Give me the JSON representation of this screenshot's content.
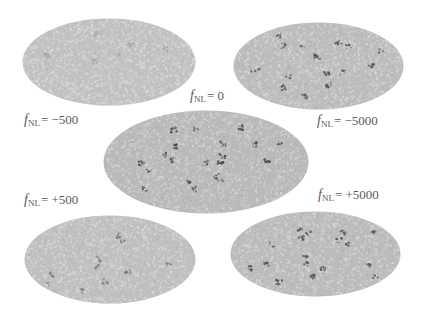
{
  "figure": {
    "maps": [
      {
        "id": "fnl-minus-500",
        "label_prefix": "f",
        "label_sub": "NL",
        "label_value": "= −500",
        "fill": "#c2c2c2",
        "speckle": "#d9d9d9",
        "spots": "#a8a8a8",
        "density": 0.2
      },
      {
        "id": "fnl-minus-5000",
        "label_prefix": "f",
        "label_sub": "NL",
        "label_value": "= −5000",
        "fill": "#bdbdbd",
        "speckle": "#d4d4d4",
        "spots": "#555555",
        "density": 0.6
      },
      {
        "id": "fnl-0",
        "label_prefix": "f",
        "label_sub": "NL",
        "label_value": "= 0",
        "fill": "#bababa",
        "speckle": "#d2d2d2",
        "spots": "#4a4a4a",
        "density": 0.7
      },
      {
        "id": "fnl-plus-500",
        "label_prefix": "f",
        "label_sub": "NL",
        "label_value": "= +500",
        "fill": "#c0c0c0",
        "speckle": "#d6d6d6",
        "spots": "#7a7a7a",
        "density": 0.35
      },
      {
        "id": "fnl-plus-5000",
        "label_prefix": "f",
        "label_sub": "NL",
        "label_value": "= +5000",
        "fill": "#bcbcbc",
        "speckle": "#d3d3d3",
        "spots": "#505050",
        "density": 0.6
      }
    ]
  }
}
